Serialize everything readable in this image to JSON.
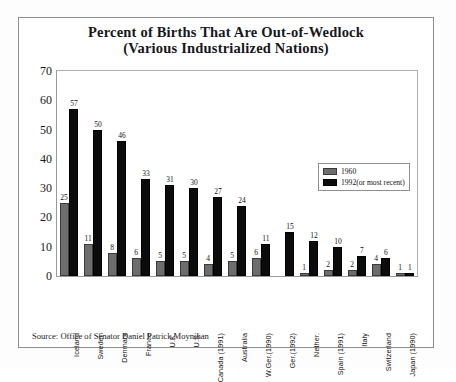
{
  "chart_data": {
    "type": "bar",
    "title": "Percent of Births That Are Out-of-Wedlock (Various Industrialized Nations)",
    "title_lines": [
      "Percent of Births That Are Out-of-Wedlock",
      "(Various Industrialized Nations)"
    ],
    "xlabel": "",
    "ylabel": "",
    "ylim": [
      0,
      70
    ],
    "ytick_values": [
      0,
      10,
      20,
      30,
      40,
      50,
      60,
      70
    ],
    "ytick_labels": [
      "0",
      "10",
      "20",
      "30",
      "40",
      "50",
      "60",
      "70"
    ],
    "grid": false,
    "legend_position": "inside-right",
    "categories": [
      "Iceland",
      "Sweden",
      "Denmark",
      "France",
      "U.K.",
      "U.S.",
      "Canada (1991)",
      "Australia",
      "W.Ger.(1990)",
      "Ger.(1992)",
      "Nether.",
      "Spain (1991)",
      "Italy",
      "Switzerland",
      "Japan (1990)"
    ],
    "series": [
      {
        "name": "1960",
        "color": "#6d6d6d",
        "values": [
          25,
          11,
          8,
          6,
          5,
          5,
          4,
          5,
          6,
          null,
          1,
          2,
          2,
          4,
          1
        ]
      },
      {
        "name": "1992(or most recent)",
        "color": "#0c0c0c",
        "values": [
          57,
          50,
          46,
          33,
          31,
          30,
          27,
          24,
          11,
          15,
          12,
          10,
          7,
          6,
          1
        ]
      }
    ],
    "annotations": {
      "source": "Source: Office of Senator Daniel Patrick Moynihan"
    }
  },
  "legend": {
    "items": [
      {
        "label": "1960",
        "swatch": "gray"
      },
      {
        "label": "1992(or most recent)",
        "swatch": "black"
      }
    ]
  },
  "source_note": "Source: Office of Senator Daniel Patrick Moynihan"
}
